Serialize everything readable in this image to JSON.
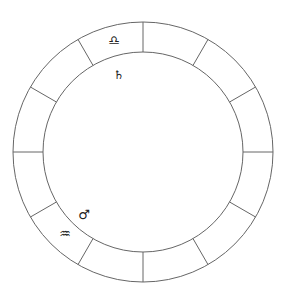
{
  "chart": {
    "type": "astrological-wheel",
    "center": [
      143,
      152
    ],
    "outer_radius": 130,
    "inner_radius": 100,
    "divisions": 12,
    "line_color": "#666666",
    "background": "#ffffff"
  },
  "glyphs": [
    {
      "name": "libra-icon",
      "char": "♎",
      "label": "Libra",
      "x": 114,
      "y": 40,
      "size": 13
    },
    {
      "name": "saturn-icon",
      "char": "♄",
      "label": "Saturn",
      "x": 119,
      "y": 75,
      "size": 12
    },
    {
      "name": "mars-icon",
      "char": "♂",
      "label": "Mars",
      "x": 84,
      "y": 214,
      "size": 13
    },
    {
      "name": "aquarius-icon",
      "char": "♒",
      "label": "Aquarius",
      "x": 65,
      "y": 233,
      "size": 13
    }
  ]
}
